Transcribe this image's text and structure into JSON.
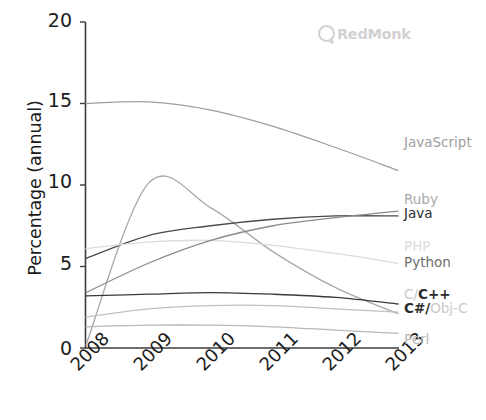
{
  "watermark": {
    "name": "RedMonk",
    "mark_icon": "redmonk-circle-icon"
  },
  "chart_data": {
    "type": "line",
    "title": "",
    "subtitle": "",
    "xlabel": "",
    "ylabel": "Percentage (annual)",
    "x": [
      2008,
      2009,
      2010,
      2011,
      2012,
      2013
    ],
    "xtick_labels": [
      "2008",
      "2009",
      "2010",
      "2011",
      "2012",
      "2013"
    ],
    "ytick_labels": [
      "0",
      "5",
      "10",
      "15",
      "20"
    ],
    "ytick_values": [
      0,
      5,
      10,
      15,
      20
    ],
    "xlim": [
      2008,
      2013
    ],
    "ylim": [
      0,
      20
    ],
    "grid": false,
    "legend_position": "right-inline-end-labels",
    "series": [
      {
        "name": "JavaScript",
        "label": "JavaScript",
        "color": "#9e9e9e",
        "values": [
          15.0,
          15.1,
          14.6,
          13.6,
          12.3,
          10.9
        ]
      },
      {
        "name": "Ruby",
        "label": "Ruby",
        "color": "#a8a8a8",
        "values": [
          0.2,
          10.1,
          8.6,
          5.9,
          3.7,
          2.1
        ]
      },
      {
        "name": "Java",
        "label": "Java",
        "color": "#4a4a4a",
        "values": [
          5.5,
          6.9,
          7.5,
          7.9,
          8.1,
          8.1
        ]
      },
      {
        "name": "PHP",
        "label": "PHP",
        "color": "#dcdcdc",
        "values": [
          6.1,
          6.5,
          6.6,
          6.3,
          5.8,
          5.2
        ]
      },
      {
        "name": "Python",
        "label": "Python",
        "color": "#8a8a8a",
        "values": [
          3.4,
          5.2,
          6.6,
          7.5,
          8.0,
          8.4
        ]
      },
      {
        "name": "C/C++",
        "label": "C/C++",
        "label_segments": [
          {
            "text": "C/",
            "dim": true
          },
          {
            "text": "C++",
            "dim": false
          }
        ],
        "color": "#3a3a3a",
        "values": [
          3.2,
          3.3,
          3.4,
          3.3,
          3.1,
          2.7
        ]
      },
      {
        "name": "C#/Obj-C",
        "label": "C#/Obj-C",
        "label_segments": [
          {
            "text": "C#/",
            "dim": false
          },
          {
            "text": "Obj-C",
            "dim": true
          }
        ],
        "color": "#c0c0c0",
        "values": [
          1.9,
          2.4,
          2.6,
          2.6,
          2.4,
          2.2
        ]
      },
      {
        "name": "Perl",
        "label": "Perl",
        "color": "#b8b8b8",
        "values": [
          1.3,
          1.4,
          1.4,
          1.3,
          1.1,
          0.9
        ]
      }
    ],
    "axis_color": "#3c3c3c"
  }
}
